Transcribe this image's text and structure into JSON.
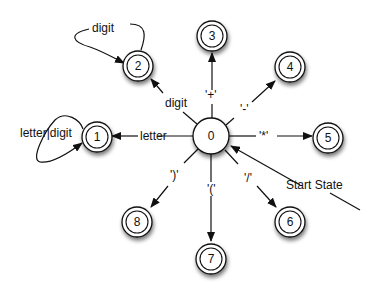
{
  "diagram": {
    "type": "finite-state-automaton",
    "start_label": "Start State",
    "states": [
      {
        "id": "0",
        "label": "0",
        "accepting": false,
        "start": true
      },
      {
        "id": "1",
        "label": "1",
        "accepting": true
      },
      {
        "id": "2",
        "label": "2",
        "accepting": true
      },
      {
        "id": "3",
        "label": "3",
        "accepting": true
      },
      {
        "id": "4",
        "label": "4",
        "accepting": true
      },
      {
        "id": "5",
        "label": "5",
        "accepting": true
      },
      {
        "id": "6",
        "label": "6",
        "accepting": true
      },
      {
        "id": "7",
        "label": "7",
        "accepting": true
      },
      {
        "id": "8",
        "label": "8",
        "accepting": true
      }
    ],
    "transitions": [
      {
        "from": "0",
        "to": "1",
        "label": "letter"
      },
      {
        "from": "0",
        "to": "2",
        "label": "digit"
      },
      {
        "from": "0",
        "to": "3",
        "label": "'+'"
      },
      {
        "from": "0",
        "to": "4",
        "label": "'-'"
      },
      {
        "from": "0",
        "to": "5",
        "label": "'*'"
      },
      {
        "from": "0",
        "to": "6",
        "label": "'/'"
      },
      {
        "from": "0",
        "to": "7",
        "label": "'('"
      },
      {
        "from": "0",
        "to": "8",
        "label": "')'"
      },
      {
        "from": "1",
        "to": "1",
        "label": "letter|digit"
      },
      {
        "from": "2",
        "to": "2",
        "label": "digit"
      }
    ]
  }
}
